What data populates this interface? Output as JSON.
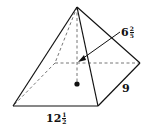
{
  "diagram": {
    "type": "rectangular pyramid",
    "labels": {
      "height": {
        "whole": "6",
        "numerator": "2",
        "denominator": "5",
        "text": "6 2/5"
      },
      "width": {
        "whole": "",
        "text": "9"
      },
      "length": {
        "whole": "12",
        "numerator": "1",
        "denominator": "2",
        "text": "12 1/2"
      }
    },
    "colors": {
      "line": "#111111",
      "dashed": "#777777",
      "background": "#ffffff"
    }
  }
}
